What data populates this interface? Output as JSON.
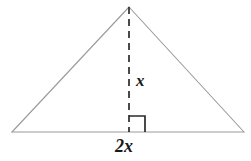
{
  "figure": {
    "type": "geometry-diagram",
    "canvas": {
      "width": 251,
      "height": 161,
      "background": "#ffffff"
    },
    "colors": {
      "triangle_stroke": "#9a9a9a",
      "altitude_stroke": "#2b2b2b",
      "right_angle_stroke": "#2b2b2b",
      "label_text": "#1a1a1a"
    },
    "vertices": {
      "apex": {
        "x": 129,
        "y": 7
      },
      "bottom_left": {
        "x": 12,
        "y": 132
      },
      "bottom_right": {
        "x": 244,
        "y": 132
      }
    },
    "altitude": {
      "from": {
        "x": 129,
        "y": 7
      },
      "to": {
        "x": 129,
        "y": 132
      },
      "style": "dashed",
      "dash_pattern": "7 5"
    },
    "right_angle_marker": {
      "corner": {
        "x": 129,
        "y": 132
      },
      "size": 16,
      "orientation": "right-of-altitude"
    },
    "labels": {
      "height": "x",
      "base": "2x"
    }
  }
}
